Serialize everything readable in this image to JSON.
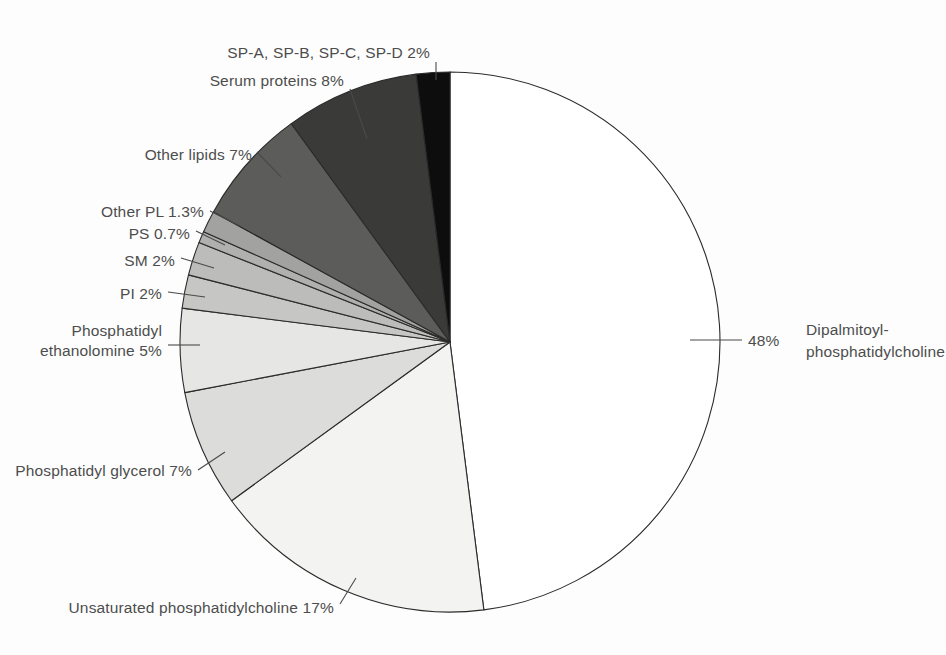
{
  "figure": {
    "background_color": "#fdfdfd",
    "text_color": "#4d4d4d",
    "outline_color": "#2b2b2b"
  },
  "chart_data": {
    "type": "pie",
    "title": "",
    "subtitle": "",
    "xlabel": "",
    "ylabel": "",
    "legend_position": "none",
    "grid": false,
    "total_percent": 100,
    "start_angle_deg": 0,
    "direction": "clockwise",
    "center": {
      "x": 450,
      "y": 342
    },
    "radius": 270,
    "categories": [
      "Dipalmitoyl-phosphatidylcholine",
      "Unsaturated phosphatidylcholine",
      "Phosphatidyl glycerol",
      "Phosphatidyl ethanolomine",
      "PI",
      "SM",
      "PS",
      "Other PL",
      "Other lipids",
      "Serum proteins",
      "SP-A, SP-B, SP-C, SP-D"
    ],
    "values": [
      48,
      17,
      7,
      5,
      2,
      2,
      0.7,
      1.3,
      7,
      8,
      2
    ],
    "colors": [
      "#ffffff",
      "#f3f3f1",
      "#dcdcda",
      "#e6e6e4",
      "#c6c6c4",
      "#bcbcba",
      "#b0b0ae",
      "#a2a2a0",
      "#5c5c5a",
      "#3a3a38",
      "#0d0d0d"
    ],
    "slices": [
      {
        "name": "Dipalmitoyl-phosphatidylcholine",
        "value": 48,
        "percent_label": "48%",
        "label_lines": [
          "Dipalmitoyl-",
          "phosphatidylcholine"
        ],
        "color": "#ffffff"
      },
      {
        "name": "Unsaturated phosphatidylcholine",
        "value": 17,
        "percent_label": "17%",
        "label_lines": [
          "Unsaturated phosphatidylcholine  17%"
        ],
        "color": "#f3f3f1"
      },
      {
        "name": "Phosphatidyl glycerol",
        "value": 7,
        "percent_label": "7%",
        "label_lines": [
          "Phosphatidyl glycerol  7%"
        ],
        "color": "#dcdcda"
      },
      {
        "name": "Phosphatidyl ethanolomine",
        "value": 5,
        "percent_label": "5%",
        "label_lines": [
          "Phosphatidyl",
          "ethanolomine  5%"
        ],
        "color": "#e6e6e4"
      },
      {
        "name": "PI",
        "value": 2,
        "percent_label": "2%",
        "label_lines": [
          "PI  2%"
        ],
        "color": "#c6c6c4"
      },
      {
        "name": "SM",
        "value": 2,
        "percent_label": "2%",
        "label_lines": [
          "SM  2%"
        ],
        "color": "#bcbcba"
      },
      {
        "name": "PS",
        "value": 0.7,
        "percent_label": "0.7%",
        "label_lines": [
          "PS  0.7%"
        ],
        "color": "#b0b0ae"
      },
      {
        "name": "Other PL",
        "value": 1.3,
        "percent_label": "1.3%",
        "label_lines": [
          "Other PL  1.3%"
        ],
        "color": "#a2a2a0"
      },
      {
        "name": "Other lipids",
        "value": 7,
        "percent_label": "7%",
        "label_lines": [
          "Other lipids  7%"
        ],
        "color": "#5c5c5a"
      },
      {
        "name": "Serum proteins",
        "value": 8,
        "percent_label": "8%",
        "label_lines": [
          "Serum proteins  8%"
        ],
        "color": "#3a3a38"
      },
      {
        "name": "SP-A, SP-B, SP-C, SP-D",
        "value": 2,
        "percent_label": "2%",
        "label_lines": [
          "SP-A, SP-B, SP-C, SP-D  2%"
        ],
        "color": "#0d0d0d"
      }
    ]
  },
  "labels": {
    "sp_proteins": "SP-A, SP-B, SP-C, SP-D  2%",
    "serum_proteins": "Serum proteins  8%",
    "other_lipids": "Other lipids  7%",
    "other_pl": "Other PL  1.3%",
    "ps": "PS  0.7%",
    "sm": "SM  2%",
    "pi": "PI  2%",
    "pe_line1": "Phosphatidyl",
    "pe_line2": "ethanolomine  5%",
    "pg": "Phosphatidyl glycerol  7%",
    "upc": "Unsaturated phosphatidylcholine  17%",
    "dppc_percent": "48%",
    "dppc_line1": "Dipalmitoyl-",
    "dppc_line2": "phosphatidylcholine"
  }
}
